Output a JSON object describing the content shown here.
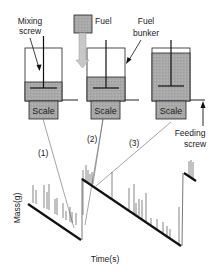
{
  "labels": {
    "mixing_screw_line1": "Mixing",
    "mixing_screw_line2": "screw",
    "fuel": "Fuel",
    "fuel_bunker_line1": "Fuel",
    "fuel_bunker_line2": "bunker",
    "feeding_screw_line1": "Feeding",
    "feeding_screw_line2": "screw",
    "scale_1": "Scale",
    "scale_2": "Scale",
    "scale_3": "Scale",
    "callout_1": "(1)",
    "callout_2": "(2)",
    "callout_3": "(3)",
    "y_axis": "Mass(g)",
    "x_axis": "Time(s)"
  },
  "colors": {
    "fill_gray": "#a8a8a8",
    "stroke": "#222222",
    "leader_line": "#555555",
    "arrow_fill": "#c8c8c8"
  },
  "stages": [
    {
      "id": 1,
      "state": "low fuel level"
    },
    {
      "id": 2,
      "state": "fuel being added from fuel supply"
    },
    {
      "id": 3,
      "state": "bunker full"
    }
  ]
}
